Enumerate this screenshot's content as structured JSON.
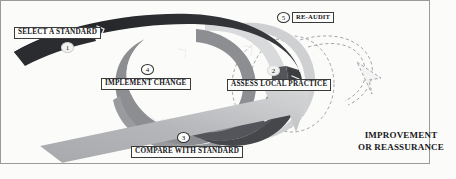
{
  "figure": {
    "background_color": "#fbfbfa",
    "border_color": "#8a8a8a"
  },
  "steps": [
    {
      "number": "1",
      "label": "SELECT A STANDARD",
      "band_color": "#2f3034"
    },
    {
      "number": "2",
      "label": "ASSESS LOCAL PRACTICE",
      "band_color": "#4d4e52"
    },
    {
      "number": "3",
      "label": "COMPARE WITH STANDARD",
      "band_color": "#8d8e92"
    },
    {
      "number": "4",
      "label": "IMPLEMENT CHANGE",
      "band_color": "#8d8e92"
    },
    {
      "number": "5",
      "label": "RE-AUDIT",
      "band_color": "#c9cacc"
    }
  ],
  "outcome": {
    "line1": "IMPROVEMENT",
    "line2": "OR REASSURANCE",
    "arrow_color_start": "#9b9c9f",
    "arrow_color_end": "#d6d7d8"
  },
  "colors": {
    "band_dark": "#2f3034",
    "band_mid_dark": "#4d4e52",
    "band_mid": "#8d8e92",
    "band_light": "#c9cacc",
    "band_pale": "#e2e3e4",
    "dashed_stroke": "#9a9b9e",
    "chevron": "#f2f2f2",
    "label_border": "#3a3a3a",
    "label_text": "#15161a"
  }
}
